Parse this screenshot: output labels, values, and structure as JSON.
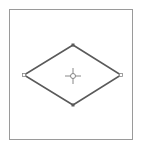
{
  "canvas": {
    "frame_color": "#9a9a9a",
    "background": "#ffffff"
  },
  "shape": {
    "type": "diamond",
    "stroke_color": "#5a5a5a",
    "handle_color": "#6a6a6a",
    "vertex_handles": [
      "top",
      "right",
      "bottom",
      "left"
    ],
    "center_marker": "crosshair-icon"
  }
}
